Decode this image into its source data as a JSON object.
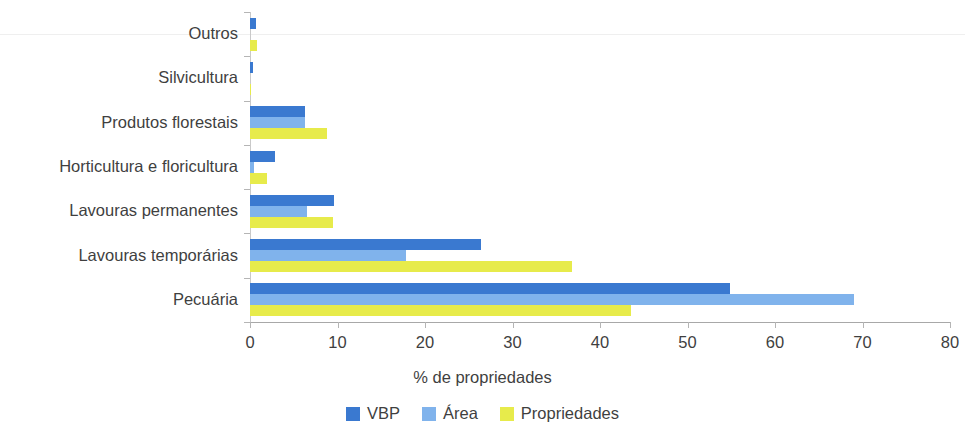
{
  "chart_data": {
    "type": "bar",
    "orientation": "horizontal",
    "title": "",
    "xlabel": "% de propriedades",
    "ylabel": "",
    "xlim": [
      0,
      80
    ],
    "xticks": [
      0,
      10,
      20,
      30,
      40,
      50,
      60,
      70,
      80
    ],
    "grid": false,
    "legend_position": "bottom",
    "categories": [
      "Outros",
      "Silvicultura",
      "Produtos florestais",
      "Horticultura e floricultura",
      "Lavouras permanentes",
      "Lavouras temporárias",
      "Pecuária"
    ],
    "series": [
      {
        "name": "VBP",
        "color": "#3a79d0",
        "values": [
          0.7,
          0.3,
          6.3,
          2.9,
          9.6,
          26.4,
          54.9
        ]
      },
      {
        "name": "Área",
        "color": "#80b3ec",
        "values": [
          0.0,
          0.0,
          6.3,
          0.5,
          6.5,
          17.8,
          69.0
        ]
      },
      {
        "name": "Propriedades",
        "color": "#e7eb4b",
        "values": [
          0.8,
          0.1,
          8.8,
          1.9,
          9.5,
          36.8,
          43.5
        ]
      }
    ]
  },
  "legend": {
    "items": [
      {
        "label": "VBP",
        "color": "#3a79d0"
      },
      {
        "label": "Área",
        "color": "#80b3ec"
      },
      {
        "label": "Propriedades",
        "color": "#e7eb4b"
      }
    ]
  },
  "axis": {
    "x_title": "% de propriedades",
    "x_tick_labels": [
      "0",
      "10",
      "20",
      "30",
      "40",
      "50",
      "60",
      "70",
      "80"
    ],
    "y_tick_labels": [
      "Outros",
      "Silvicultura",
      "Produtos florestais",
      "Horticultura e floricultura",
      "Lavouras permanentes",
      "Lavouras temporárias",
      "Pecuária"
    ]
  }
}
